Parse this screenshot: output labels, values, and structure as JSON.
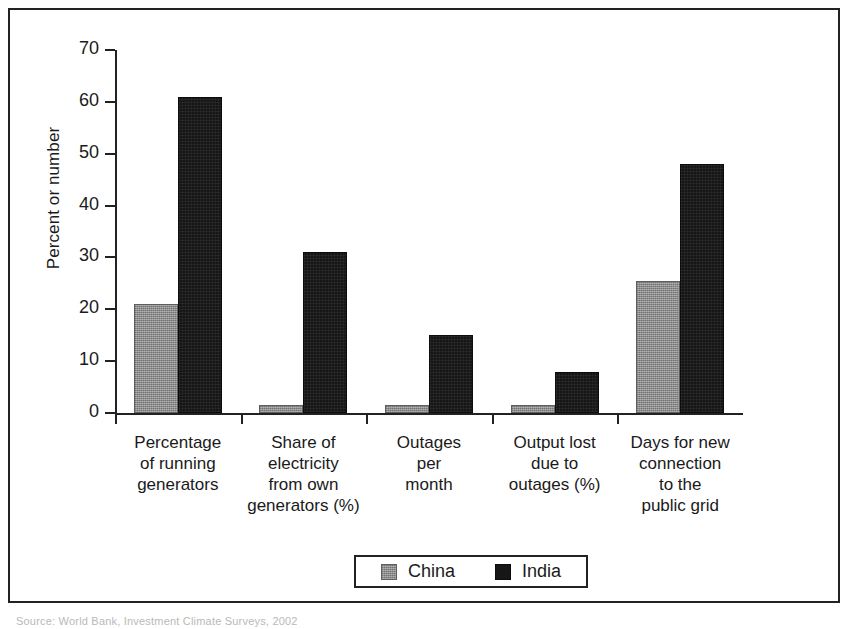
{
  "figure": {
    "background_color": "#ffffff",
    "border_color": "#222222",
    "source_caption": "Source: World Bank, Investment Climate Surveys, 2002"
  },
  "legend": {
    "position": "bottom-center",
    "boxed": true,
    "entries": [
      {
        "label": "China",
        "color": "#8c8c8c",
        "swatch": "china"
      },
      {
        "label": "India",
        "color": "#161616",
        "swatch": "india"
      }
    ]
  },
  "chart_data": {
    "type": "bar",
    "title": "",
    "xlabel": "",
    "ylabel": "Percent or number",
    "ylim": [
      0,
      70
    ],
    "yticks": [
      0,
      10,
      20,
      30,
      40,
      50,
      60,
      70
    ],
    "ytick_labels": [
      "0",
      "10",
      "20",
      "30",
      "40",
      "50",
      "60",
      "70"
    ],
    "grid": false,
    "legend_position": "bottom",
    "categories": [
      "Percentage\nof running\ngenerators",
      "Share of\nelectricity\nfrom own\ngenerators (%)",
      "Outages\nper\nmonth",
      "Output lost\ndue to\noutages (%)",
      "Days for new\nconnection\nto the\npublic grid"
    ],
    "series": [
      {
        "name": "China",
        "color": "#8c8c8c",
        "values": [
          21,
          1.5,
          1.5,
          1.5,
          25.5
        ]
      },
      {
        "name": "India",
        "color": "#161616",
        "values": [
          61,
          31,
          15,
          8,
          48
        ]
      }
    ]
  }
}
